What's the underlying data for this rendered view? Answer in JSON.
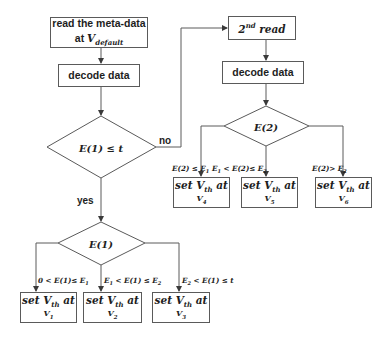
{
  "diagram": {
    "type": "flowchart",
    "colors": {
      "stroke": "#5a5a5a",
      "text": "#1e1e1e",
      "background": "#ffffff"
    },
    "nodes": {
      "read_meta": {
        "line1": "read the meta-data",
        "line2_prefix": "at ",
        "line2_var": "V",
        "line2_sub": "default"
      },
      "decode_left": {
        "label": "decode data"
      },
      "decision_1": {
        "label": "E(1) ≤ t"
      },
      "second_read": {
        "sup_num": "2",
        "sup": "nd",
        "label": " read"
      },
      "decode_right": {
        "label": "decode data"
      },
      "decision_2": {
        "label": "E(2)"
      },
      "decision_e1": {
        "label": "E(1)"
      },
      "set_v4": {
        "line1_prefix": "set V",
        "line1_sub": "th",
        "line1_suffix": " at",
        "line2_var": "V",
        "line2_sub": "4"
      },
      "set_v5": {
        "line1_prefix": "set V",
        "line1_sub": "th",
        "line1_suffix": " at",
        "line2_var": "V",
        "line2_sub": "5"
      },
      "set_v6": {
        "line1_prefix": "set V",
        "line1_sub": "th",
        "line1_suffix": " at",
        "line2_var": "V",
        "line2_sub": "6"
      },
      "set_v1": {
        "line1_prefix": "set V",
        "line1_sub": "th",
        "line1_suffix": " at",
        "line2_var": "V",
        "line2_sub": "1"
      },
      "set_v2": {
        "line1_prefix": "set V",
        "line1_sub": "th",
        "line1_suffix": " at",
        "line2_var": "V",
        "line2_sub": "2"
      },
      "set_v3": {
        "line1_prefix": "set V",
        "line1_sub": "th",
        "line1_suffix": " at",
        "line2_var": "V",
        "line2_sub": "3"
      }
    },
    "edge_labels": {
      "no": "no",
      "yes": "yes",
      "e2_low": {
        "a": "E(2) ≤ E",
        "a_sub": "1"
      },
      "e2_mid": {
        "a": "E",
        "a_sub": "1",
        "b": " < E(2)≤ E",
        "b_sub": "2"
      },
      "e2_high": {
        "a": "E(2)> E",
        "a_sub": "2"
      },
      "e1_low": {
        "a": "0 < E(1)≤ E",
        "a_sub": "1"
      },
      "e1_mid": {
        "a": "E",
        "a_sub": "1",
        "b": " < E(1) ≤ E",
        "b_sub": "2"
      },
      "e1_high": {
        "a": "E",
        "a_sub": "2",
        "b": " < E(1) ≤ t"
      }
    }
  }
}
